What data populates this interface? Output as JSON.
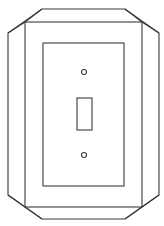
{
  "illustration": {
    "subject": "toggle-light-switch-wall-plate",
    "colors": {
      "background": "#ffffff",
      "stroke": "#3a3a3a"
    },
    "outer_octagon": {
      "points": "42,9 125,9 159,33 159,195 125,219 42,219 8,195 8,33"
    },
    "frame_rect": {
      "x": 25,
      "y": 22,
      "width": 117,
      "height": 185
    },
    "inner_panel": {
      "x": 43,
      "y": 43,
      "width": 81,
      "height": 143
    },
    "screw_top": {
      "cx": 84,
      "cy": 72,
      "r": 2.5
    },
    "toggle": {
      "x": 77,
      "y": 98,
      "width": 15,
      "height": 32
    },
    "screw_bottom": {
      "cx": 84,
      "cy": 155,
      "r": 2.5
    }
  }
}
